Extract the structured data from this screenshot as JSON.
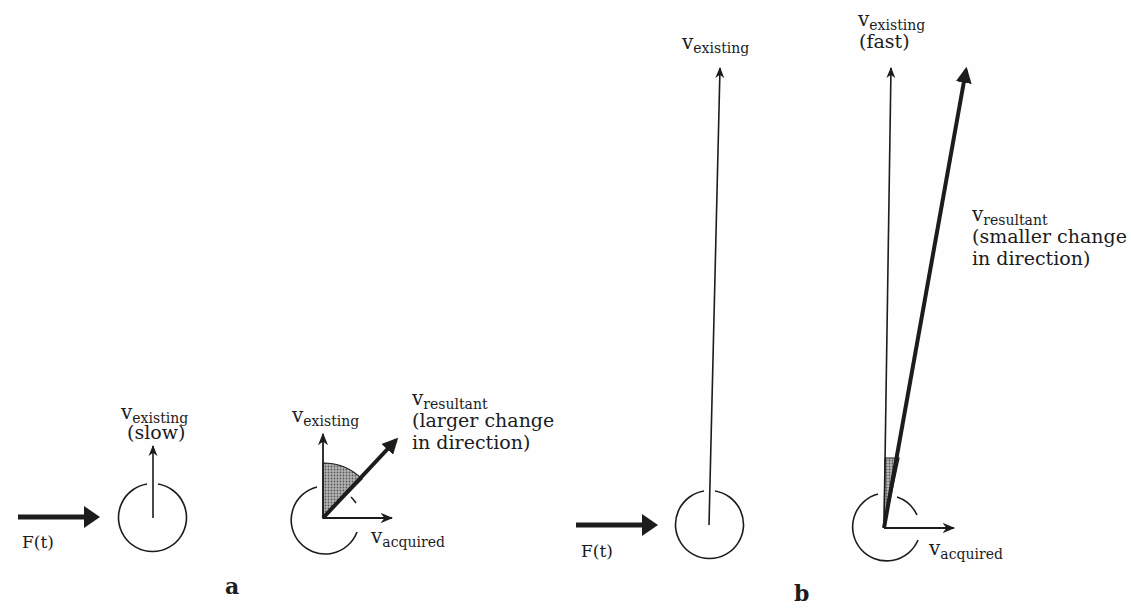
{
  "diagram": {
    "panels": [
      {
        "id": "a",
        "label": "a",
        "force_label": "F(t)",
        "initial": {
          "vector_symbol": "v",
          "vector_subscript": "existing",
          "qualifier": "(slow)"
        },
        "resultant_view": {
          "existing": {
            "symbol": "v",
            "subscript": "existing"
          },
          "resultant": {
            "symbol": "v",
            "subscript": "resultant",
            "note_line1": "(larger change",
            "note_line2": "in direction)"
          },
          "acquired": {
            "symbol": "v",
            "subscript": "acquired"
          }
        }
      },
      {
        "id": "b",
        "label": "b",
        "force_label": "F(t)",
        "initial": {
          "vector_symbol": "v",
          "vector_subscript": "existing"
        },
        "resultant_view": {
          "existing": {
            "symbol": "v",
            "subscript": "existing",
            "qualifier": "(fast)"
          },
          "resultant": {
            "symbol": "v",
            "subscript": "resultant",
            "note_line1": "(smaller change",
            "note_line2": "in direction)"
          },
          "acquired": {
            "symbol": "v",
            "subscript": "acquired"
          }
        }
      }
    ],
    "colors": {
      "ink": "#1c1c1c",
      "shade": "#8a8a8a",
      "background": "#fefefe"
    }
  }
}
